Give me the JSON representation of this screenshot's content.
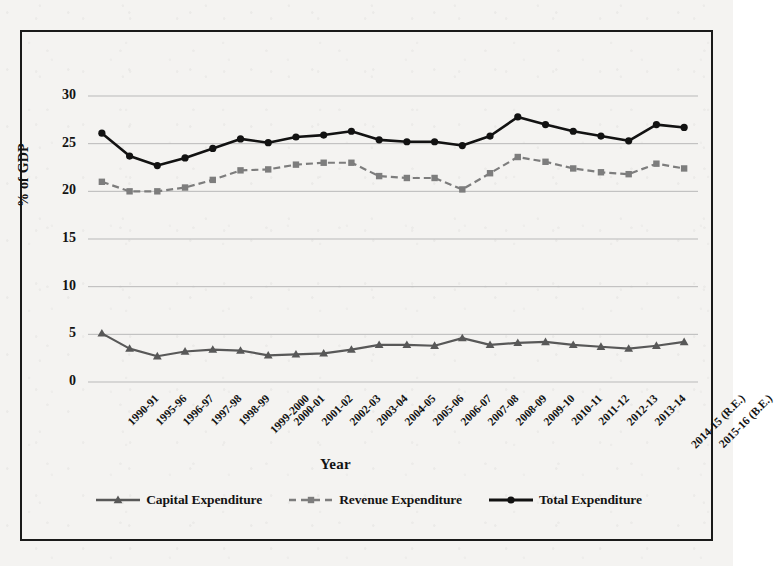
{
  "chart_data": {
    "type": "line",
    "title": "",
    "xlabel": "Year",
    "ylabel": "% of GDP",
    "ylim": [
      0,
      30
    ],
    "yticks": [
      "0",
      "5",
      "10",
      "15",
      "20",
      "25",
      "30"
    ],
    "grid": true,
    "legend_position": "bottom",
    "categories": [
      "1990-91",
      "1995-96",
      "1996-97",
      "1997-98",
      "1998-99",
      "1999-2000",
      "2000-01",
      "2001-02",
      "2002-03",
      "2003-04",
      "2004-05",
      "2005-06",
      "2006-07",
      "2007-08",
      "2008-09",
      "2009-10",
      "2010-11",
      "2011-12",
      "2012-13",
      "2013-14",
      "2014-15 (R.E.)",
      "2015-16 (B.E.)"
    ],
    "series": [
      {
        "name": "Capital Expenditure",
        "color": "#585858",
        "marker": "triangle",
        "dash": "solid",
        "values": [
          5.1,
          3.5,
          2.7,
          3.2,
          3.4,
          3.3,
          2.8,
          2.9,
          3.0,
          3.4,
          3.9,
          3.9,
          3.8,
          4.6,
          3.9,
          4.1,
          4.2,
          3.9,
          3.7,
          3.5,
          3.8,
          4.2
        ]
      },
      {
        "name": "Revenue Expenditure",
        "color": "#7d7d7d",
        "marker": "square",
        "dash": "dashed",
        "values": [
          21.0,
          20.0,
          20.0,
          20.4,
          21.2,
          22.2,
          22.3,
          22.8,
          23.0,
          23.0,
          21.6,
          21.4,
          21.4,
          20.2,
          21.9,
          23.6,
          23.1,
          22.4,
          22.0,
          21.8,
          22.9,
          22.4
        ]
      },
      {
        "name": "Total Expenditure",
        "color": "#121212",
        "marker": "circle",
        "dash": "solid",
        "values": [
          26.1,
          23.7,
          22.7,
          23.5,
          24.5,
          25.5,
          25.1,
          25.7,
          25.9,
          26.3,
          25.4,
          25.2,
          25.2,
          24.8,
          25.8,
          27.8,
          27.0,
          26.3,
          25.8,
          25.3,
          27.0,
          26.7
        ]
      }
    ]
  },
  "legend": {
    "items": [
      {
        "label": "Capital Expenditure"
      },
      {
        "label": "Revenue Expenditure"
      },
      {
        "label": "Total Expenditure"
      }
    ]
  }
}
